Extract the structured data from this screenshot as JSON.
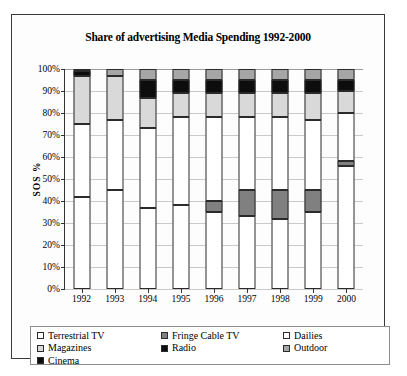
{
  "chart_data": {
    "type": "bar",
    "subtype": "stacked-bar-100",
    "title": "Share of advertising Media Spending 1992-2000",
    "xlabel": "",
    "ylabel": "SOS %",
    "ylim": [
      0,
      100
    ],
    "ytick_labels": [
      "0%",
      "10%",
      "20%",
      "30%",
      "40%",
      "50%",
      "60%",
      "70%",
      "80%",
      "90%",
      "100%"
    ],
    "ytick_values": [
      0,
      10,
      20,
      30,
      40,
      50,
      60,
      70,
      80,
      90,
      100
    ],
    "grid": true,
    "legend_position": "bottom",
    "categories": [
      "1992",
      "1993",
      "1994",
      "1995",
      "1996",
      "1997",
      "1998",
      "1999",
      "2000"
    ],
    "series": [
      {
        "name": "Terrestrial TV",
        "color": "#ffffff",
        "values": [
          42,
          45,
          37,
          38,
          35,
          33,
          32,
          35,
          56
        ]
      },
      {
        "name": "Fringe Cable TV",
        "color": "#808080",
        "values": [
          0,
          0,
          0,
          0,
          5,
          12,
          13,
          10,
          2
        ]
      },
      {
        "name": "Dailies",
        "color": "#ffffff",
        "values": [
          33,
          32,
          36,
          40,
          38,
          33,
          33,
          32,
          22
        ]
      },
      {
        "name": "Magazines",
        "color": "#d9d9d9",
        "values": [
          22,
          20,
          14,
          11,
          11,
          11,
          11,
          12,
          10
        ]
      },
      {
        "name": "Radio",
        "color": "#0d0d0d",
        "values": [
          2,
          0,
          8,
          6,
          6,
          6,
          6,
          6,
          5
        ]
      },
      {
        "name": "Cinema",
        "color": "#0d0d0d",
        "values": [
          0,
          0,
          0,
          0,
          0,
          0,
          0,
          0,
          0
        ]
      },
      {
        "name": "Outdoor",
        "color": "#a6a6a6",
        "values": [
          1,
          3,
          5,
          5,
          5,
          5,
          5,
          5,
          5
        ]
      }
    ],
    "legend_columns": [
      [
        "Terrestrial TV",
        "Magazines",
        "Cinema"
      ],
      [
        "Fringe Cable TV",
        "Radio"
      ],
      [
        "Dailies",
        "Outdoor"
      ]
    ],
    "legend_colors": {
      "Terrestrial TV": "#ffffff",
      "Magazines": "#d9d9d9",
      "Cinema": "#0d0d0d",
      "Fringe Cable TV": "#808080",
      "Radio": "#0d0d0d",
      "Dailies": "#ffffff",
      "Outdoor": "#a6a6a6"
    }
  }
}
